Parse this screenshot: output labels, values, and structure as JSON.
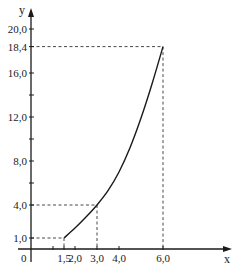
{
  "chart_data": {
    "type": "line",
    "title": "",
    "xlabel": "x",
    "ylabel": "y",
    "xlim": [
      0,
      8.9
    ],
    "ylim": [
      0,
      20.8
    ],
    "grid": false,
    "legend": null,
    "x_ticks": [
      {
        "value": 1.0,
        "label": ""
      },
      {
        "value": 1.5,
        "label": "1,5"
      },
      {
        "value": 2.0,
        "label": "2,0"
      },
      {
        "value": 3.0,
        "label": "3,0"
      },
      {
        "value": 4.0,
        "label": "4,0"
      },
      {
        "value": 6.0,
        "label": "6,0"
      }
    ],
    "y_ticks": [
      {
        "value": 1.0,
        "label": "1,0"
      },
      {
        "value": 4.0,
        "label": "4,0"
      },
      {
        "value": 6.0,
        "label": ""
      },
      {
        "value": 8.0,
        "label": "8,0"
      },
      {
        "value": 10.0,
        "label": ""
      },
      {
        "value": 12.0,
        "label": "12,0"
      },
      {
        "value": 14.0,
        "label": ""
      },
      {
        "value": 16.0,
        "label": "16,0"
      },
      {
        "value": 18.4,
        "label": "18,4"
      },
      {
        "value": 20.0,
        "label": "20,0"
      }
    ],
    "origin_label": "0",
    "series": [
      {
        "name": "curve",
        "x": [
          1.5,
          2.0,
          2.5,
          3.0,
          3.5,
          4.0,
          4.5,
          5.0,
          5.5,
          6.0
        ],
        "y": [
          1.0,
          1.9,
          2.9,
          4.0,
          5.3,
          7.0,
          9.2,
          11.9,
          15.0,
          18.4
        ]
      }
    ],
    "annotations": [
      {
        "type": "dashed-guide",
        "point": [
          1.5,
          1.0
        ]
      },
      {
        "type": "dashed-guide",
        "point": [
          3.0,
          4.0
        ]
      },
      {
        "type": "dashed-guide",
        "point": [
          6.0,
          18.4
        ]
      }
    ]
  }
}
